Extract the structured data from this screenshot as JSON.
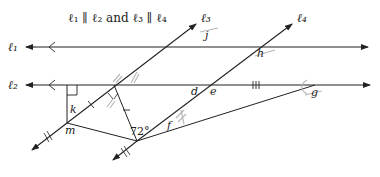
{
  "title": "ℓ₁ ∥ ℓ₂ and ℓ₃ ∥ ℓ₄",
  "lines": {
    "l1": "ℓ₁",
    "l2": "ℓ₂",
    "l3": "ℓ₃",
    "l4": "ℓ₄"
  },
  "angle_labels": {
    "j": "j",
    "h": "h",
    "d": "d",
    "e": "e",
    "g": "g",
    "k": "k",
    "m": "m",
    "f": "f",
    "given_angle": "72°"
  },
  "tick_marks": {
    "triple": "III"
  },
  "colors": {
    "line": "#222222",
    "pencil": "#b8b8b8"
  }
}
